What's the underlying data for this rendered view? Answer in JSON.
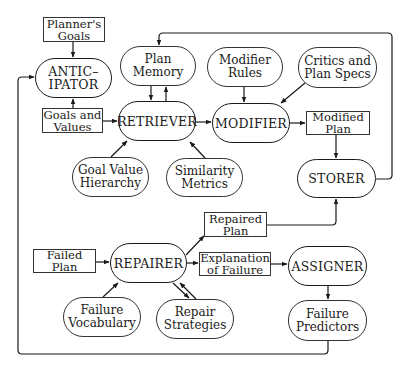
{
  "diagram": {
    "processes": {
      "anticipator": "ANTIC–\nIPATOR",
      "retriever": "RETRIEVER",
      "modifier": "MODIFIER",
      "storer": "STORER",
      "repairer": "REPAIRER",
      "assigner": "ASSIGNER"
    },
    "data_boxes": {
      "planners_goals": "Planner's\nGoals",
      "goals_and_values": "Goals and\nValues",
      "modified_plan": "Modified\nPlan",
      "repaired_plan": "Repaired\nPlan",
      "failed_plan": "Failed\nPlan",
      "explanation_of_failure": "Explanation\nof Failure"
    },
    "knowledge_stores": {
      "plan_memory": "Plan\nMemory",
      "modifier_rules": "Modifier\nRules",
      "critics_and_plan_specs": "Critics and\nPlan Specs",
      "goal_value_hierarchy": "Goal Value\nHierarchy",
      "similarity_metrics": "Similarity\nMetrics",
      "failure_vocabulary": "Failure\nVocabulary",
      "repair_strategies": "Repair\nStrategies",
      "failure_predictors": "Failure\nPredictors"
    },
    "edges": [
      {
        "from": "Planner's Goals",
        "to": "ANTICIPATOR"
      },
      {
        "from": "Goals and Values",
        "to": "ANTICIPATOR"
      },
      {
        "from": "Goals and Values",
        "to": "RETRIEVER"
      },
      {
        "from": "Plan Memory",
        "to": "RETRIEVER"
      },
      {
        "from": "RETRIEVER",
        "to": "Plan Memory"
      },
      {
        "from": "Goal Value Hierarchy",
        "to": "RETRIEVER"
      },
      {
        "from": "Similarity Metrics",
        "to": "RETRIEVER"
      },
      {
        "from": "RETRIEVER",
        "to": "MODIFIER"
      },
      {
        "from": "Modifier Rules",
        "to": "MODIFIER"
      },
      {
        "from": "Critics and Plan Specs",
        "to": "MODIFIER"
      },
      {
        "from": "MODIFIER",
        "to": "Modified Plan"
      },
      {
        "from": "Modified Plan",
        "to": "STORER"
      },
      {
        "from": "STORER",
        "to": "Plan Memory"
      },
      {
        "from": "Failed Plan",
        "to": "REPAIRER"
      },
      {
        "from": "Failure Vocabulary",
        "to": "REPAIRER"
      },
      {
        "from": "Repair Strategies",
        "to": "REPAIRER"
      },
      {
        "from": "REPAIRER",
        "to": "Repair Strategies"
      },
      {
        "from": "REPAIRER",
        "to": "Repaired Plan"
      },
      {
        "from": "REPAIRER",
        "to": "Explanation of Failure"
      },
      {
        "from": "Repaired Plan",
        "to": "STORER"
      },
      {
        "from": "Explanation of Failure",
        "to": "ASSIGNER"
      },
      {
        "from": "ASSIGNER",
        "to": "Failure Predictors"
      },
      {
        "from": "Failure Predictors",
        "to": "ANTICIPATOR"
      }
    ]
  }
}
